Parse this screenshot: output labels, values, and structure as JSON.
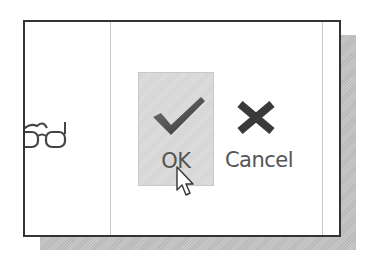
{
  "dialog": {
    "ok": {
      "label": "OK",
      "icon": "checkmark-icon",
      "state": "hovered"
    },
    "cancel": {
      "label": "Cancel",
      "icon": "x-icon"
    },
    "left_panel": {
      "icon": "glasses-icon"
    }
  },
  "colors": {
    "frame_border": "#333333",
    "ok_hover_bg": "#d9d9d9",
    "icon_dark": "#3a3a3a",
    "label_text": "#555555",
    "shadow": "#c0c0c0"
  },
  "cursor": {
    "type": "arrow-pointer",
    "over": "ok"
  }
}
